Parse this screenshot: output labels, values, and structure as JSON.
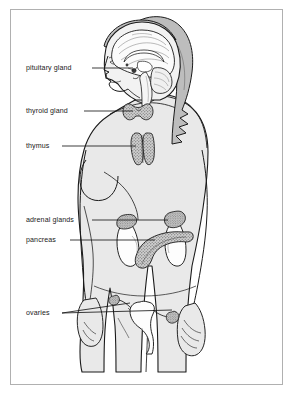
{
  "figure": {
    "page_width": 295,
    "page_height": 396,
    "border_color": "#b0b0b0",
    "background_color": "#ffffff",
    "body_fill_color": "#e9e9e9",
    "hair_fill_color": "#bdbdbd",
    "organ_fill_color": "#bfbfbf",
    "outline_color": "#1a1a1a",
    "leader_line_color": "#1a1a1a"
  },
  "labels": [
    {
      "id": "pituitary-gland",
      "text": "pituitary gland",
      "text_x": 26,
      "text_y": 70,
      "leader": [
        [
          92,
          68
        ],
        [
          133,
          68
        ]
      ],
      "target": "pituitary gland in the brain, behind the eye"
    },
    {
      "id": "thyroid-gland",
      "text": "thyroid gland",
      "text_x": 26,
      "text_y": 113,
      "leader": [
        [
          84,
          111
        ],
        [
          133,
          111
        ]
      ],
      "target": "thyroid gland at the base of the neck"
    },
    {
      "id": "thymus",
      "text": "thymus",
      "text_x": 26,
      "text_y": 148,
      "leader": [
        [
          62,
          146
        ],
        [
          136,
          146
        ]
      ],
      "target": "thymus behind the upper sternum"
    },
    {
      "id": "adrenal-glands",
      "text": "adrenal glands",
      "text_x": 26,
      "text_y": 222,
      "leader": [
        [
          92,
          220
        ],
        [
          168,
          220
        ]
      ],
      "target": "adrenal glands atop each kidney"
    },
    {
      "id": "pancreas",
      "text": "pancreas",
      "text_x": 26,
      "text_y": 242,
      "leader": [
        [
          70,
          240
        ],
        [
          155,
          240
        ]
      ],
      "target": "pancreas behind the stomach"
    },
    {
      "id": "ovaries",
      "text": "ovaries",
      "text_x": 26,
      "text_y": 315,
      "leader_a": [
        [
          62,
          313
        ],
        [
          130,
          303
        ]
      ],
      "leader_b": [
        [
          62,
          313
        ],
        [
          172,
          310
        ]
      ],
      "target": "a pair of ovaries beside the uterus"
    }
  ],
  "organs": [
    {
      "id": "pituitary-gland",
      "name": "pituitary gland",
      "shaded": true
    },
    {
      "id": "thyroid-gland",
      "name": "thyroid gland",
      "shaded": true
    },
    {
      "id": "thymus",
      "name": "thymus",
      "shaded": true
    },
    {
      "id": "adrenal-gland-left",
      "name": "adrenal gland",
      "shaded": true
    },
    {
      "id": "adrenal-gland-right",
      "name": "adrenal gland",
      "shaded": true
    },
    {
      "id": "kidney-left",
      "name": "kidney",
      "shaded": false
    },
    {
      "id": "kidney-right",
      "name": "kidney",
      "shaded": false
    },
    {
      "id": "pancreas",
      "name": "pancreas",
      "shaded": true
    },
    {
      "id": "uterus",
      "name": "uterus",
      "shaded": false
    },
    {
      "id": "ovary-left",
      "name": "ovary",
      "shaded": true
    },
    {
      "id": "ovary-right",
      "name": "ovary",
      "shaded": true
    },
    {
      "id": "brain",
      "name": "brain (sagittal section)",
      "shaded": false
    }
  ]
}
